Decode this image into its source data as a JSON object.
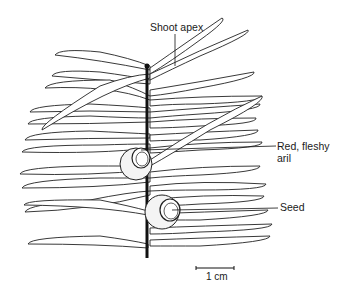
{
  "figure": {
    "labels": {
      "shoot_apex": "Shoot apex",
      "aril_line1": "Red, fleshy",
      "aril_line2": "aril",
      "seed": "Seed"
    },
    "scale_bar": {
      "label": "1 cm"
    }
  }
}
